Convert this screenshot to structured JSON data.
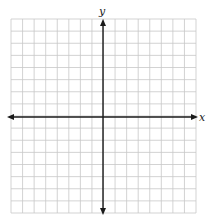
{
  "diagram": {
    "type": "coordinate-plane",
    "grid": {
      "columns": 16,
      "rows": 16,
      "left": 11,
      "top": 19,
      "right": 196,
      "bottom": 213,
      "line_color": "#c8c8c8"
    },
    "axes": {
      "origin_px": [
        103,
        117
      ],
      "color": "#1a1a1a",
      "x_label": "x",
      "y_label": "y"
    }
  }
}
